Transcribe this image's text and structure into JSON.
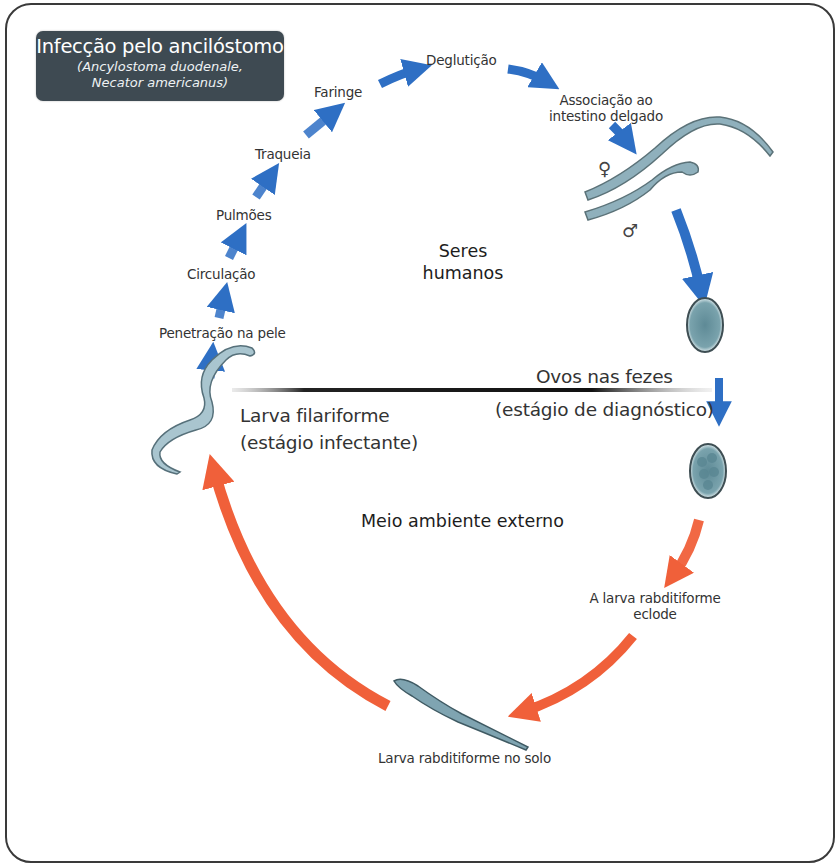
{
  "title_box": {
    "title": "Infecção pelo ancilóstomo",
    "subtitle_line1": "(Ancylostoma duodenale,",
    "subtitle_line2": "Necator americanus)",
    "background_color": "#3e4a52"
  },
  "zones": {
    "human_line1": "Seres",
    "human_line2": "humanos",
    "external": "Meio ambiente externo"
  },
  "human_stages": [
    {
      "label": "Penetração na pele"
    },
    {
      "label": "Circulação"
    },
    {
      "label": "Pulmões"
    },
    {
      "label": "Traqueia"
    },
    {
      "label": "Faringe"
    },
    {
      "label": "Deglutição"
    },
    {
      "label_line1": "Associação ao",
      "label_line2": "intestino delgado"
    }
  ],
  "adults": {
    "female_symbol": "♀",
    "male_symbol": "♂"
  },
  "eggs": {
    "label_line1": "Ovos nas fezes",
    "label_line2": "(estágio de diagnóstico)"
  },
  "external_stages": {
    "hatch_line1": "A larva rabditiforme",
    "hatch_line2": "eclode",
    "soil": "Larva rabditiforme no solo"
  },
  "infective_stage": {
    "label_line1": "Larva filariforme",
    "label_line2": "(estágio infectante)"
  },
  "colors": {
    "human_arrow": "#2e6fc4",
    "external_arrow": "#f0603a",
    "worm_fill": "#8fb0bc",
    "egg_fill": "#6f98a4",
    "frame": "#3a3a3a"
  }
}
